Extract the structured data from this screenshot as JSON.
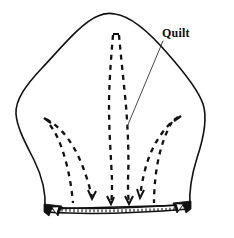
{
  "figure": {
    "type": "line-art-diagram",
    "background_color": "#ffffff",
    "ink_color": "#111111",
    "canvas": {
      "width": 234,
      "height": 238
    }
  },
  "labels": [
    {
      "id": "quilt",
      "text": "Quilt",
      "x": 162,
      "y": 27,
      "bold": true,
      "leader_from": [
        163,
        40
      ],
      "leader_to": [
        127,
        127
      ]
    }
  ],
  "panel": {
    "name": "quilted-panel-outline",
    "description": "Rounded pentagon / shield shaped fabric panel with peaked top and flat hemmed bottom edge",
    "apex": [
      115,
      14
    ],
    "bottom_left": [
      42,
      208
    ],
    "bottom_right": [
      192,
      205
    ],
    "stroke_color": "#111111",
    "stroke_width": 1.6,
    "fill_color": "#ffffff"
  },
  "hem": {
    "name": "hem-band",
    "description": "Narrow double-line hem band across bottom edge with running stitch ticks",
    "left": [
      45,
      209
    ],
    "right": [
      190,
      206
    ],
    "band_height": 4,
    "stitch_count": 34,
    "stroke_color": "#111111"
  },
  "notches": [
    {
      "id": "notch-left",
      "x": 52,
      "y": 209,
      "mirrored": false
    },
    {
      "id": "notch-right",
      "x": 180,
      "y": 207,
      "mirrored": true
    }
  ],
  "quilting_lines": {
    "description": "Dashed quilting stitch lines forming a central spear and two curved side sprays",
    "dash_pattern": "5 5",
    "stroke_color": "#111111",
    "groups": [
      {
        "id": "center-left",
        "description": "center spear left dashed line, from top near apex down to hem"
      },
      {
        "id": "center-right",
        "description": "center spear right dashed line, from top near apex down to hem"
      },
      {
        "id": "left-spray-outer",
        "description": "left curved dashed line sweeping up to the left"
      },
      {
        "id": "left-spray-inner",
        "description": "left curved dashed line inner, parallel to outer"
      },
      {
        "id": "right-spray-outer",
        "description": "right curved dashed line sweeping up to the right"
      },
      {
        "id": "right-spray-inner",
        "description": "right curved dashed line inner, parallel to outer"
      }
    ]
  }
}
